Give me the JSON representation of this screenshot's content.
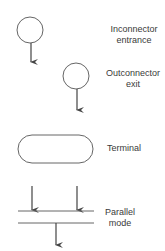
{
  "symbols": [
    {
      "id": "inconnector",
      "shape": "circle-with-down-arrow",
      "label_line1": "Inconnector",
      "label_line2": "entrance"
    },
    {
      "id": "outconnector",
      "shape": "circle-with-down-arrow",
      "label_line1": "Outconnector",
      "label_line2": "exit"
    },
    {
      "id": "terminal",
      "shape": "rounded-rectangle",
      "label_line1": "Terminal"
    },
    {
      "id": "parallel",
      "shape": "double-horizontal-bars-with-arrows",
      "label_line1": "Parallel",
      "label_line2": "mode"
    }
  ],
  "colors": {
    "stroke": "#555555",
    "text": "#3a3a3a",
    "background": "#ffffff"
  }
}
